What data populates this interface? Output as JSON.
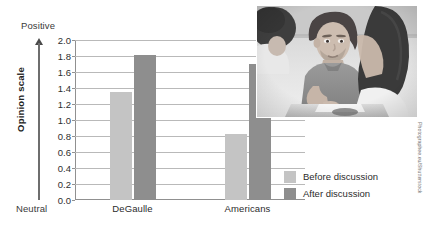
{
  "chart_data": {
    "type": "bar",
    "title": "",
    "xlabel": "",
    "ylabel": "Opinion scale",
    "ylim": [
      0.0,
      2.0
    ],
    "ytick_step": 0.2,
    "grid": true,
    "legend_position": "bottom-right",
    "categories": [
      "DeGaulle",
      "Americans"
    ],
    "series": [
      {
        "name": "Before discussion",
        "color": "#c4c4c4",
        "values": [
          1.35,
          0.83
        ]
      },
      {
        "name": "After discussion",
        "color": "#8e8e8e",
        "values": [
          1.81,
          1.7
        ]
      }
    ],
    "yticks": [
      "0.0",
      "0.2",
      "0.4",
      "0.6",
      "0.8",
      "1.0",
      "1.2",
      "1.4",
      "1.6",
      "1.8",
      "2.0"
    ],
    "ytick_values": [
      0.0,
      0.2,
      0.4,
      0.6,
      0.8,
      1.0,
      1.2,
      1.4,
      1.6,
      1.8,
      2.0
    ],
    "scale_anchors": {
      "top": "Positive",
      "bottom": "Neutral"
    }
  },
  "legend": {
    "items": [
      {
        "label": "Before discussion",
        "color": "#c4c4c4"
      },
      {
        "label": "After discussion",
        "color": "#8e8e8e"
      }
    ]
  },
  "photo": {
    "alt": "Students seated at a table having a group discussion",
    "credit": "Photographee.eu/Shutterstock"
  }
}
